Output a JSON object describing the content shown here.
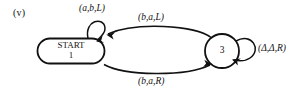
{
  "figure": {
    "part_label": "(v)",
    "background_color": "#ffffff",
    "ink_color": "#111111",
    "type": "turing-machine-state-diagram"
  },
  "states": [
    {
      "id": "1",
      "name": "start-state",
      "shape": "stadium",
      "line1": "START",
      "line2": "1",
      "is_start": true
    },
    {
      "id": "3",
      "name": "state-3",
      "shape": "circle",
      "line1": "3",
      "is_start": false
    }
  ],
  "transitions": [
    {
      "name": "self-loop-state1",
      "from": "1",
      "to": "1",
      "label": "(a,b,L)",
      "read": "a",
      "write": "b",
      "move": "L",
      "position": "above-state-1"
    },
    {
      "name": "arc-3-to-1",
      "from": "3",
      "to": "1",
      "label": "(b,a,L)",
      "read": "b",
      "write": "a",
      "move": "L",
      "position": "upper-arc"
    },
    {
      "name": "arc-1-to-3",
      "from": "1",
      "to": "3",
      "label": "(b,a,R)",
      "read": "b",
      "write": "a",
      "move": "R",
      "position": "lower-arc"
    },
    {
      "name": "self-loop-state3",
      "from": "3",
      "to": "3",
      "label": "(Δ,Δ,R)",
      "read": "Δ",
      "write": "Δ",
      "move": "R",
      "position": "right-of-state-3"
    }
  ]
}
